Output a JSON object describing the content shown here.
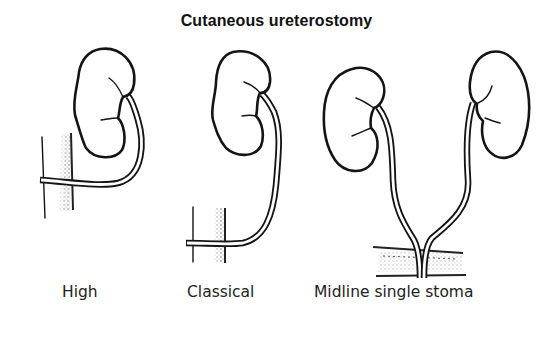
{
  "figure": {
    "title": "Cutaneous ureterostomy",
    "panels": [
      {
        "id": "high",
        "label": "High",
        "kidneys": 1,
        "stoma_position": "flank, high"
      },
      {
        "id": "classical",
        "label": "Classical",
        "kidneys": 1,
        "stoma_position": "lower, iliac"
      },
      {
        "id": "midline",
        "label": "Midline single stoma",
        "kidneys": 2,
        "stoma_position": "midline, both ureters joined"
      }
    ]
  },
  "colors": {
    "ink": "#141414",
    "background": "#ffffff"
  }
}
